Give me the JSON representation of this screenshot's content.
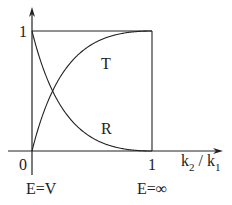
{
  "diagram": {
    "y_tick_1": "1",
    "x_tick_0": "0",
    "x_tick_1": "1",
    "x_axis_label_k2": "k",
    "x_axis_label_sub2": "2",
    "x_axis_label_slash": " / ",
    "x_axis_label_k1": "k",
    "x_axis_label_sub1": "1",
    "curve_T_label": "T",
    "curve_R_label": "R",
    "left_annotation": "E=V",
    "right_annotation": "E=∞"
  },
  "chart_data": {
    "type": "line",
    "title": "",
    "xlabel": "k2 / k1",
    "ylabel": "",
    "xlim": [
      0,
      1
    ],
    "ylim": [
      0,
      1
    ],
    "x_ticks": [
      "0",
      "1"
    ],
    "y_ticks": [
      "1"
    ],
    "annotations": [
      "E=V at x=0",
      "E=∞ at x=1"
    ],
    "series": [
      {
        "name": "T",
        "formula": "4x/(1+x)^2",
        "x": [
          0,
          0.1,
          0.2,
          0.3,
          0.4,
          0.5,
          0.6,
          0.7,
          0.8,
          0.9,
          1.0
        ],
        "values": [
          0,
          0.331,
          0.556,
          0.71,
          0.816,
          0.889,
          0.938,
          0.969,
          0.988,
          0.997,
          1.0
        ]
      },
      {
        "name": "R",
        "formula": "((1-x)/(1+x))^2",
        "x": [
          0,
          0.1,
          0.2,
          0.3,
          0.4,
          0.5,
          0.6,
          0.7,
          0.8,
          0.9,
          1.0
        ],
        "values": [
          1,
          0.669,
          0.444,
          0.29,
          0.184,
          0.111,
          0.063,
          0.031,
          0.012,
          0.003,
          0
        ]
      }
    ],
    "grid": false,
    "legend": "none (inline labels T and R)"
  }
}
